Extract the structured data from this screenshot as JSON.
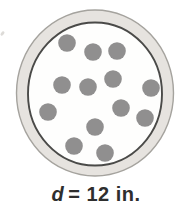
{
  "figure": {
    "kind": "circle-with-dots-diagram",
    "colors": {
      "background": "#ffffff",
      "rim_fill": "#e6e3df",
      "rim_edge": "#a5a39e",
      "inner_ring_stroke": "#4a4a48",
      "interior_fill": "#fefefd",
      "dot_fill": "#908f8f",
      "label_color": "#2e2e2e"
    },
    "geometry": {
      "center_x": 95,
      "center_y": 93,
      "outer_rx": 78.5,
      "outer_ry": 83,
      "inner_rx": 67,
      "inner_ry": 71.5,
      "dot_radius": 8.8
    },
    "dot_count": 13,
    "dots": [
      {
        "x": 67,
        "y": 43
      },
      {
        "x": 93,
        "y": 52
      },
      {
        "x": 117,
        "y": 51
      },
      {
        "x": 62,
        "y": 85
      },
      {
        "x": 88,
        "y": 87
      },
      {
        "x": 113,
        "y": 79
      },
      {
        "x": 151,
        "y": 88
      },
      {
        "x": 48,
        "y": 112
      },
      {
        "x": 121,
        "y": 108
      },
      {
        "x": 145,
        "y": 118
      },
      {
        "x": 95,
        "y": 127
      },
      {
        "x": 74,
        "y": 146
      },
      {
        "x": 105,
        "y": 153
      }
    ]
  },
  "label": {
    "variable": "d",
    "text": "= 12 in."
  }
}
